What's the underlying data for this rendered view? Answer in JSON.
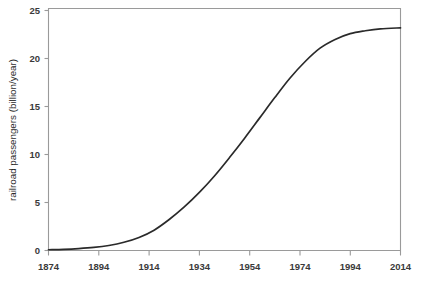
{
  "chart_data": {
    "type": "line",
    "title": "",
    "subtitle": "",
    "xlabel": "",
    "ylabel": "railroad passengers (billion/year)",
    "xlim": [
      1874,
      2014
    ],
    "ylim": [
      0,
      25
    ],
    "grid": false,
    "legend": null,
    "xticks": [
      1874,
      1894,
      1914,
      1934,
      1954,
      1974,
      1994,
      2014
    ],
    "xtick_labels": [
      "1874",
      "1894",
      "1914",
      "1934",
      "1954",
      "1974",
      "1994",
      "2014"
    ],
    "yticks": [
      0,
      5,
      10,
      15,
      20,
      25
    ],
    "ytick_labels": [
      "0",
      "5",
      "10",
      "15",
      "20",
      "25"
    ],
    "series": [
      {
        "name": "railroad passengers",
        "color": "#2a2a2a",
        "x": [
          1874,
          1880,
          1886,
          1892,
          1898,
          1904,
          1910,
          1916,
          1922,
          1928,
          1934,
          1940,
          1946,
          1952,
          1958,
          1964,
          1970,
          1976,
          1982,
          1988,
          1994,
          2000,
          2006,
          2014
        ],
        "y": [
          0.08,
          0.12,
          0.2,
          0.32,
          0.52,
          0.85,
          1.35,
          2.1,
          3.2,
          4.5,
          6.0,
          7.7,
          9.6,
          11.6,
          13.7,
          15.8,
          17.8,
          19.5,
          20.9,
          21.8,
          22.4,
          22.7,
          22.9,
          23.0
        ]
      }
    ],
    "annotations": [],
    "axis_color": "#9a9a9a",
    "curve_color": "#2a2a2a",
    "background_color": "#ffffff"
  },
  "figure": {
    "alt": "S-shaped logistic growth curve of railroad passengers per year from 1874 to 2014"
  }
}
